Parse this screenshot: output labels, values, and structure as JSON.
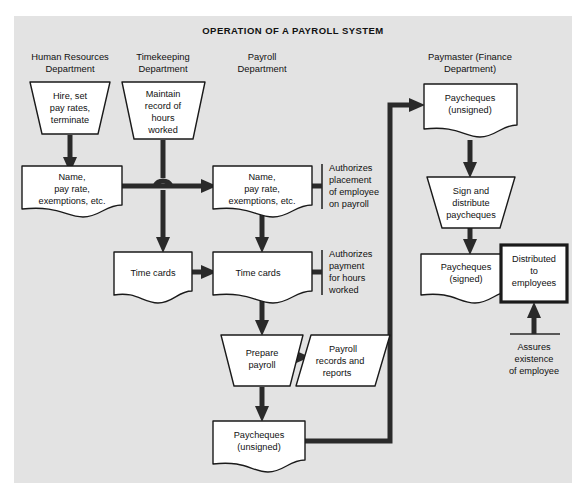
{
  "title": "OPERATION OF A PAYROLL SYSTEM",
  "columns": [
    {
      "id": "human-resources",
      "line1": "Human Resources",
      "line2": "Department"
    },
    {
      "id": "timekeeping",
      "line1": "Timekeeping",
      "line2": "Department"
    },
    {
      "id": "payroll",
      "line1": "Payroll",
      "line2": "Department"
    },
    {
      "id": "paymaster",
      "line1": "Paymaster (Finance",
      "line2": "Department)"
    }
  ],
  "nodes": {
    "hire": {
      "shape": "process-trapezoid",
      "lines": [
        "Hire, set",
        "pay rates,",
        "terminate"
      ]
    },
    "maintain": {
      "shape": "process-trapezoid",
      "lines": [
        "Maintain",
        "record of",
        "hours",
        "worked"
      ]
    },
    "name_hr": {
      "shape": "document",
      "lines": [
        "Name,",
        "pay rate,",
        "exemptions, etc."
      ]
    },
    "name_payroll": {
      "shape": "document",
      "lines": [
        "Name,",
        "pay rate,",
        "exemptions, etc."
      ]
    },
    "timecards_tk": {
      "shape": "document",
      "lines": [
        "Time cards"
      ]
    },
    "timecards_pr": {
      "shape": "document",
      "lines": [
        "Time cards"
      ]
    },
    "prepare": {
      "shape": "process-trapezoid",
      "lines": [
        "Prepare",
        "payroll"
      ]
    },
    "records": {
      "shape": "parallelogram",
      "lines": [
        "Payroll",
        "records and",
        "reports"
      ]
    },
    "cheques_unsigned_payroll": {
      "shape": "document",
      "lines": [
        "Paycheques",
        "(unsigned)"
      ]
    },
    "cheques_unsigned_paymaster": {
      "shape": "document",
      "lines": [
        "Paycheques",
        "(unsigned)"
      ]
    },
    "sign": {
      "shape": "process-trapezoid",
      "lines": [
        "Sign and",
        "distribute",
        "paycheques"
      ]
    },
    "cheques_signed": {
      "shape": "document",
      "lines": [
        "Paycheques",
        "(signed)"
      ]
    },
    "distributed": {
      "shape": "terminator-box",
      "lines": [
        "Distributed",
        "to",
        "employees"
      ]
    }
  },
  "annotations": {
    "authorizes_placement": {
      "lines": [
        "Authorizes",
        "placement",
        "of employee",
        "on payroll"
      ]
    },
    "authorizes_payment": {
      "lines": [
        "Authorizes",
        "payment",
        "for hours",
        "worked"
      ]
    },
    "assures_existence": {
      "lines": [
        "Assures",
        "existence",
        "of employee"
      ]
    }
  },
  "colors": {
    "canvas": "#ffffff",
    "frame": "#e3e3e3",
    "shape_fill": "#ffffff",
    "stroke": "#1a1a1a",
    "connector": "#2a2a2a",
    "text": "#111111"
  }
}
